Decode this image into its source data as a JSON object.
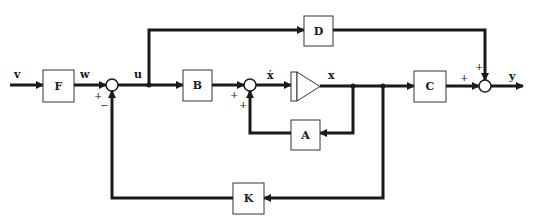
{
  "diagram": {
    "type": "block-diagram",
    "blocks": {
      "F": {
        "label": "F"
      },
      "B": {
        "label": "B"
      },
      "A": {
        "label": "A"
      },
      "C": {
        "label": "C"
      },
      "D": {
        "label": "D"
      },
      "K": {
        "label": "K"
      }
    },
    "signals": {
      "v": "v",
      "w": "w",
      "u": "u",
      "xdot": "ẋ",
      "x": "x",
      "y": "y"
    },
    "summing_junctions": {
      "sum1": {
        "signs": {
          "left": "+",
          "bottom": "−"
        }
      },
      "sum2": {
        "signs": {
          "left": "+",
          "bottom": "+"
        }
      },
      "sum3": {
        "signs": {
          "left": "+",
          "top": "+"
        }
      }
    },
    "integrator": {
      "name": "integrator"
    },
    "colors": {
      "line": "#1a1a1a",
      "background": "#ffffff"
    }
  }
}
